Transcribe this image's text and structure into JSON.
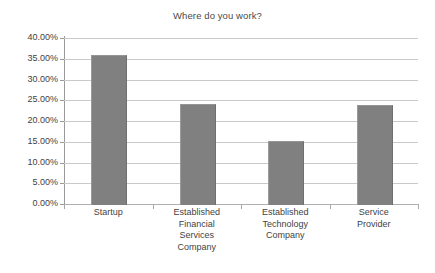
{
  "chart_data": {
    "type": "bar",
    "title": "Where do you work?",
    "xlabel": "",
    "ylabel": "",
    "categories": [
      "Startup",
      "Established Financial Services Company",
      "Established Technology Company",
      "Service Provider"
    ],
    "category_lines": [
      [
        "Startup"
      ],
      [
        "Established",
        "Financial",
        "Services",
        "Company"
      ],
      [
        "Established",
        "Technology",
        "Company"
      ],
      [
        "Service",
        "Provider"
      ]
    ],
    "values": [
      35.8,
      24.1,
      15.2,
      23.9
    ],
    "value_labels": [
      "35.80%",
      "24.10%",
      "15.20%",
      "23.90%"
    ],
    "ylim": [
      0,
      40
    ],
    "ytick_values": [
      40,
      35,
      30,
      25,
      20,
      15,
      10,
      5,
      0
    ],
    "ytick_labels": [
      "40.00%",
      "35.00%",
      "30.00%",
      "25.00%",
      "20.00%",
      "15.00%",
      "10.00%",
      "5.00%",
      "0.00%"
    ],
    "grid": true,
    "grid_orientation": "horizontal",
    "legend": false,
    "legend_position": "none",
    "bar_color": "#808080",
    "grid_color": "#c9c9c9",
    "axis_color": "#9a9a9a",
    "text_color": "#3f3f3f",
    "background_color": "#ffffff"
  }
}
